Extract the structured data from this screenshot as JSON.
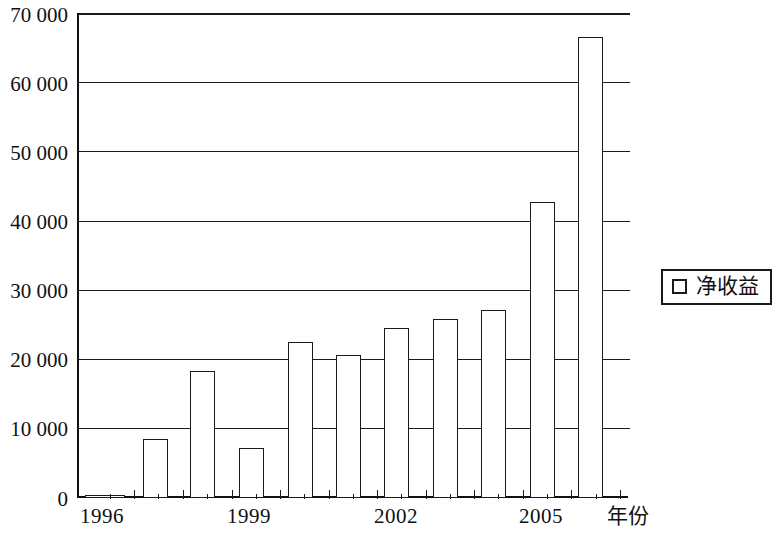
{
  "chart_data": {
    "type": "bar",
    "title": "",
    "subtitle": "",
    "xlabel": "年份",
    "ylabel": "",
    "categories": [
      "1996",
      "1997",
      "1998",
      "1999",
      "2000",
      "2001",
      "2002",
      "2003",
      "2004",
      "2005",
      "2006"
    ],
    "values": [
      300,
      8500,
      18400,
      7200,
      22500,
      20700,
      24600,
      25900,
      27200,
      42700,
      66600
    ],
    "series": [
      {
        "name": "净收益",
        "values": [
          300,
          8500,
          18400,
          7200,
          22500,
          20700,
          24600,
          25900,
          27200,
          42700,
          66600
        ]
      }
    ],
    "ylim": [
      0,
      70000
    ],
    "ytick_values": [
      0,
      10000,
      20000,
      30000,
      40000,
      50000,
      60000,
      70000
    ],
    "ytick_labels": [
      "0",
      "10 000",
      "20 000",
      "30 000",
      "40 000",
      "50 000",
      "60 000",
      "70 000"
    ],
    "xtick_labels": [
      "1996",
      "1999",
      "2002",
      "2005"
    ],
    "xtick_categories": [
      "1996",
      "1999",
      "2002",
      "2005"
    ],
    "grid": true,
    "grid_axis": "y",
    "legend": {
      "position": "right",
      "entries": [
        {
          "label": "净收益",
          "marker": "open-square",
          "color": "#ffffff",
          "edge_color": "#1a1a1a"
        }
      ]
    },
    "axis_color": "#1a1a1a",
    "bar_fill": "#ffffff",
    "bar_edge": "#1a1a1a",
    "background": "#ffffff"
  },
  "axis": {
    "x_title": "年份"
  },
  "legend": {
    "label": "净收益"
  }
}
